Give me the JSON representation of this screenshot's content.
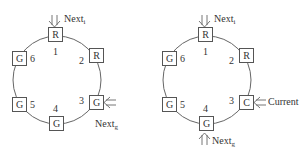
{
  "diagrams": [
    {
      "name": "left",
      "nodes": [
        {
          "id": "1",
          "state": "R"
        },
        {
          "id": "2",
          "state": "R"
        },
        {
          "id": "3",
          "state": "G"
        },
        {
          "id": "4",
          "state": "G"
        },
        {
          "id": "5",
          "state": "G"
        },
        {
          "id": "6",
          "state": "G"
        }
      ],
      "pointers": {
        "next_i": {
          "base": "Next",
          "sub": "i",
          "target": "1"
        },
        "next_g": {
          "base": "Next",
          "sub": "g",
          "target": "3"
        }
      }
    },
    {
      "name": "right",
      "nodes": [
        {
          "id": "1",
          "state": "R"
        },
        {
          "id": "2",
          "state": "R"
        },
        {
          "id": "3",
          "state": "C"
        },
        {
          "id": "4",
          "state": "G"
        },
        {
          "id": "5",
          "state": "G"
        },
        {
          "id": "6",
          "state": "G"
        }
      ],
      "pointers": {
        "next_i": {
          "base": "Next",
          "sub": "i",
          "target": "1"
        },
        "current": {
          "label": "Current",
          "target": "3"
        },
        "next_g": {
          "base": "Next",
          "sub": "g",
          "target": "4"
        }
      }
    }
  ]
}
